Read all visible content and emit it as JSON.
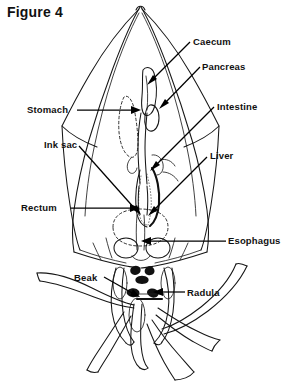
{
  "figure": {
    "title": "Figure 4",
    "background_color": "#ffffff",
    "ink_color": "#111111"
  },
  "labels": [
    {
      "id": "caecum",
      "text": "Caecum",
      "x": 193,
      "y": 36,
      "side": "right"
    },
    {
      "id": "pancreas",
      "text": "Pancreas",
      "x": 202,
      "y": 61,
      "side": "right"
    },
    {
      "id": "stomach",
      "text": "Stomach",
      "x": 27,
      "y": 104,
      "side": "left"
    },
    {
      "id": "intestine",
      "text": "Intestine",
      "x": 217,
      "y": 101,
      "side": "right"
    },
    {
      "id": "ink-sac",
      "text": "Ink sac",
      "x": 44,
      "y": 139,
      "side": "left"
    },
    {
      "id": "liver",
      "text": "Liver",
      "x": 210,
      "y": 150,
      "side": "right"
    },
    {
      "id": "rectum",
      "text": "Rectum",
      "x": 21,
      "y": 202,
      "side": "left"
    },
    {
      "id": "esophagus",
      "text": "Esophagus",
      "x": 228,
      "y": 235,
      "side": "right"
    },
    {
      "id": "beak",
      "text": "Beak",
      "x": 74,
      "y": 272,
      "side": "left"
    },
    {
      "id": "radula",
      "text": "Radula",
      "x": 187,
      "y": 287,
      "side": "right"
    }
  ],
  "anatomy_parts": [
    "mantle",
    "fin",
    "caecum",
    "pancreas",
    "stomach",
    "intestine",
    "ink sac",
    "liver",
    "rectum",
    "esophagus",
    "beak",
    "radula",
    "arms",
    "tentacles",
    "funnel"
  ]
}
